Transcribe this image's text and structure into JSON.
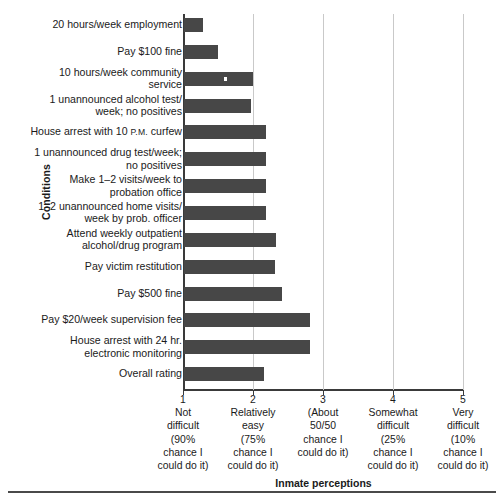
{
  "chart_data": {
    "type": "bar",
    "orientation": "horizontal",
    "title": "",
    "xlabel": "Inmate perceptions",
    "ylabel": "Conditions",
    "xlim": [
      1,
      5
    ],
    "grid": true,
    "legend": "none",
    "bar_color": "#474747",
    "categories": [
      "20 hours/week employment",
      "Pay $100 fine",
      "10 hours/week community\nservice",
      "1 unannounced alcohol test/\nweek; no positives",
      "House arrest with 10 P.M. curfew",
      "1 unannounced drug test/week;\nno positives",
      "Make 1–2 visits/week to\nprobation office",
      "1–2 unannounced home visits/\nweek by prob. officer",
      "Attend weekly outpatient\nalcohol/drug program",
      "Pay victim restitution",
      "Pay $500 fine",
      "Pay $20/week supervision fee",
      "House arrest with 24 hr.\nelectronic monitoring",
      "Overall rating"
    ],
    "values": [
      1.29,
      1.5,
      2.0,
      1.97,
      2.19,
      2.19,
      2.19,
      2.19,
      2.33,
      2.31,
      2.41,
      2.81,
      2.81,
      2.16
    ],
    "xticks": [
      {
        "value": "1",
        "label": "Not\ndifficult\n(90%\nchance I\ncould do it)"
      },
      {
        "value": "2",
        "label": "Relatively\neasy\n(75%\nchance I\ncould do it)"
      },
      {
        "value": "3",
        "label": "(About\n50/50\nchance I\ncould do it)"
      },
      {
        "value": "4",
        "label": "Somewhat\ndifficult\n(25%\nchance I\ncould do it)"
      },
      {
        "value": "5",
        "label": "Very\ndifficult\n(10%\nchance I\ncould do it)"
      }
    ]
  }
}
